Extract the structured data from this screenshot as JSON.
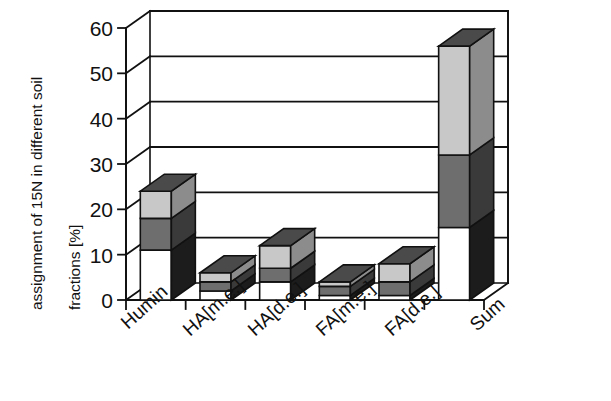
{
  "chart_data": {
    "type": "bar",
    "subtype": "stacked-3d-column",
    "title": "",
    "xlabel": "",
    "ylabel": "assignment of 15N in different soil fractions [%]",
    "ylabel_lines": [
      "assignment of 15N in different soil",
      "fractions [%]"
    ],
    "categories": [
      "Humin",
      "HA[m.e.]",
      "HA[d.e.]",
      "FA[m.e.]",
      "FA[d.e.]",
      "Sum"
    ],
    "series": [
      {
        "name": "bottom-segment",
        "fill": "#ffffff",
        "values": [
          11,
          2,
          4,
          1,
          1,
          16
        ]
      },
      {
        "name": "middle-segment",
        "fill": "#6e6e6e",
        "values": [
          7,
          2,
          3,
          2,
          3,
          16
        ]
      },
      {
        "name": "top-segment",
        "fill": "#c8c8c8",
        "values": [
          6,
          2,
          5,
          1,
          4,
          24
        ]
      }
    ],
    "totals": [
      24,
      6,
      12,
      4,
      8,
      56
    ],
    "ylim": [
      0,
      60
    ],
    "yticks": [
      0,
      10,
      20,
      30,
      40,
      50,
      60
    ],
    "ytick_labels": [
      "0",
      "10",
      "20",
      "30",
      "40",
      "50",
      "60"
    ],
    "grid": true,
    "grid_axis": "y",
    "legend": "none",
    "colors": {
      "bottom_face": "#ffffff",
      "middle_face": "#6e6e6e",
      "top_face": "#c8c8c8",
      "side_bottom": "#1c1c1c",
      "side_middle": "#3a3a3a",
      "side_top": "#8c8c8c",
      "cap_top": "#4a4a4a",
      "axis": "#111111",
      "grid_line": "#111111",
      "background": "#ffffff"
    }
  },
  "axes": {
    "y_title_line1": "assignment of 15N in different soil",
    "y_title_line2": "fractions [%]",
    "y_tick_0": "0",
    "y_tick_10": "10",
    "y_tick_20": "20",
    "y_tick_30": "30",
    "y_tick_40": "40",
    "y_tick_50": "50",
    "y_tick_60": "60",
    "x_tick_0": "Humin",
    "x_tick_1": "HA[m.e.]",
    "x_tick_2": "HA[d.e.]",
    "x_tick_3": "FA[m.e.]",
    "x_tick_4": "FA[d.e.]",
    "x_tick_5": "Sum"
  }
}
